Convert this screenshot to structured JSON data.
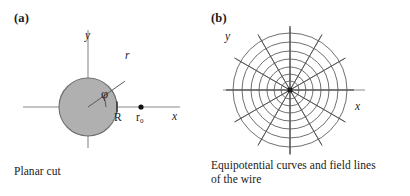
{
  "figure": {
    "panels": [
      {
        "tag": "(a)",
        "caption": "Planar cut",
        "axes": {
          "x_label": "x",
          "y_label": "y"
        },
        "labels": {
          "radius_vector": "r",
          "angle": "φ",
          "wire_radius": "R",
          "field_point": "r₀"
        },
        "geometry": {
          "circle_fill": "#b0b0b0",
          "circle_stroke": "#6e6e6e",
          "axis_color": "#8a8a8a",
          "center": [
            88,
            107
          ],
          "circle_radius_px": 29,
          "ray_angle_deg": 35,
          "point_r0_x_px": 141
        }
      },
      {
        "tag": "(b)",
        "caption": "Equipotential curves and field lines\nof the wire",
        "axes": {
          "x_label": "x",
          "y_label": "y"
        },
        "geometry": {
          "center": [
            85,
            90
          ],
          "equipotential_count": 7,
          "equipotential_radii_px": [
            9,
            16,
            23,
            31,
            39,
            48,
            57
          ],
          "field_line_count": 12,
          "field_line_angles_deg": [
            0,
            30,
            60,
            90,
            120,
            150,
            180,
            210,
            240,
            270,
            300,
            330
          ],
          "field_line_length_px": 64,
          "curve_color": "#555555",
          "axis_color": "#8a8a8a",
          "wire_dot_color": "#1a1a1a"
        }
      }
    ]
  }
}
